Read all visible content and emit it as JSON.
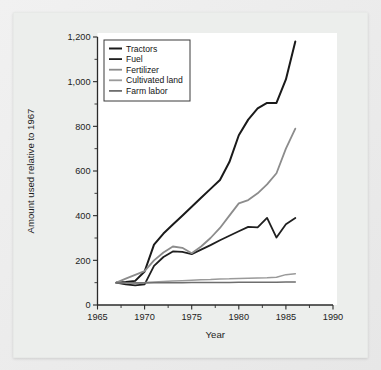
{
  "figure": {
    "background_color": "#ebebeb",
    "plot_background_color": "#ffffff"
  },
  "chart_data": {
    "type": "line",
    "title": "",
    "xlabel": "Year",
    "ylabel": "Amount used relative to 1967",
    "xlim": [
      1965,
      1990
    ],
    "ylim": [
      0,
      1200
    ],
    "xticks": [
      1965,
      1970,
      1975,
      1980,
      1985,
      1990
    ],
    "xticklabels": [
      "1965",
      "1970",
      "1975",
      "1980",
      "1985",
      "1990"
    ],
    "yticks": [
      0,
      200,
      400,
      600,
      800,
      1000,
      1200
    ],
    "yticklabels": [
      "0",
      "200",
      "400",
      "600",
      "800",
      "1,000",
      "1,200"
    ],
    "y_minor_ticks": [
      100,
      300,
      500,
      700,
      900,
      1100
    ],
    "x_minor_ticks": [
      1967.5,
      1972.5,
      1977.5,
      1982.5,
      1987.5
    ],
    "grid": false,
    "legend_position": "upper left",
    "x": [
      1967,
      1968,
      1969,
      1970,
      1971,
      1972,
      1973,
      1974,
      1975,
      1976,
      1977,
      1978,
      1979,
      1980,
      1981,
      1982,
      1983,
      1984,
      1985,
      1986
    ],
    "series": [
      {
        "name": "Tractors",
        "color": "#1a1a1a",
        "width": 2.0,
        "values": [
          100,
          103,
          108,
          150,
          270,
          320,
          360,
          400,
          440,
          480,
          520,
          560,
          640,
          760,
          830,
          880,
          905,
          905,
          1010,
          1180
        ]
      },
      {
        "name": "Fuel",
        "color": "#1f1f1f",
        "width": 1.8,
        "values": [
          100,
          92,
          88,
          92,
          175,
          215,
          240,
          238,
          228,
          248,
          268,
          290,
          310,
          330,
          350,
          348,
          390,
          302,
          362,
          390
        ]
      },
      {
        "name": "Fertilizer",
        "color": "#8c8c8c",
        "width": 1.8,
        "values": [
          100,
          118,
          135,
          152,
          200,
          235,
          262,
          256,
          232,
          262,
          300,
          345,
          400,
          455,
          470,
          500,
          540,
          590,
          700,
          790
        ]
      },
      {
        "name": "Cultivated land",
        "color": "#9a9a9a",
        "width": 1.5,
        "values": [
          100,
          100,
          100,
          101,
          103,
          105,
          107,
          109,
          111,
          113,
          114,
          116,
          117,
          119,
          120,
          121,
          122,
          124,
          136,
          140
        ]
      },
      {
        "name": "Farm labor",
        "color": "#6e6e6e",
        "width": 1.5,
        "values": [
          100,
          100,
          99,
          99,
          100,
          100,
          100,
          100,
          101,
          101,
          101,
          101,
          101,
          102,
          102,
          102,
          102,
          102,
          103,
          103
        ]
      }
    ]
  }
}
